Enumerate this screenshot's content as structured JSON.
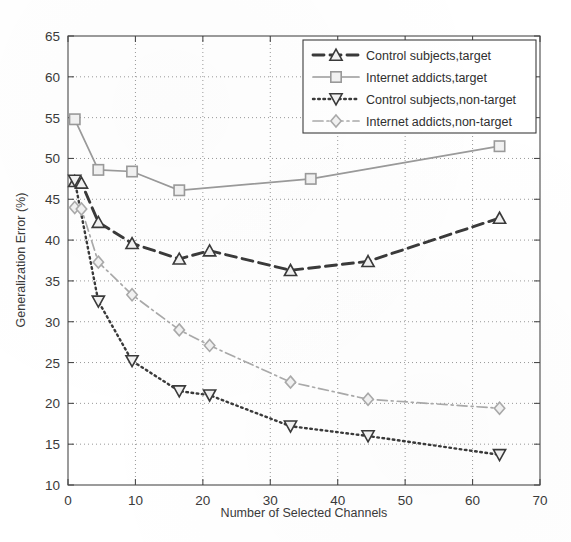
{
  "chart_data": {
    "type": "line",
    "title": "",
    "xlabel": "Number of Selected Channels",
    "ylabel": "Generalization Error (%)",
    "xlim": [
      0,
      70
    ],
    "ylim": [
      10,
      65
    ],
    "xticks": [
      0,
      10,
      20,
      30,
      40,
      50,
      60,
      70
    ],
    "yticks": [
      10,
      15,
      20,
      25,
      30,
      35,
      40,
      45,
      50,
      55,
      60,
      65
    ],
    "grid": true,
    "grid_style": "dotted",
    "legend_position": "top-right",
    "series": [
      {
        "name": "Control subjects,target",
        "marker": "triangle-up",
        "linestyle": "dashed",
        "color": "#3a3a3a",
        "x": [
          1,
          2,
          4.5,
          9.5,
          16.5,
          21,
          33,
          44.5,
          64
        ],
        "y": [
          47.2,
          47.0,
          42.2,
          39.6,
          37.7,
          38.7,
          36.3,
          37.4,
          42.7
        ]
      },
      {
        "name": "Internet addicts,target",
        "marker": "square",
        "linestyle": "solid",
        "color": "#9a9a9a",
        "x": [
          1,
          4.5,
          9.5,
          16.5,
          36,
          64
        ],
        "y": [
          54.8,
          48.6,
          48.4,
          46.1,
          47.5,
          51.5
        ]
      },
      {
        "name": "Control subjects,non-target",
        "marker": "triangle-down",
        "linestyle": "dotted",
        "color": "#3a3a3a",
        "x": [
          1,
          4.5,
          9.5,
          16.5,
          21,
          33,
          44.5,
          64
        ],
        "y": [
          47.3,
          32.5,
          25.2,
          21.5,
          21.0,
          17.2,
          16.0,
          13.7
        ]
      },
      {
        "name": "Internet addicts,non-target",
        "marker": "diamond",
        "linestyle": "dashdot",
        "color": "#aaaaaa",
        "x": [
          1,
          2,
          4.5,
          9.5,
          16.5,
          21,
          33,
          44.5,
          64
        ],
        "y": [
          44.0,
          43.8,
          37.3,
          33.3,
          29.0,
          27.1,
          22.6,
          20.5,
          19.4
        ]
      }
    ]
  },
  "legend": {
    "items": [
      {
        "label": "Control subjects,target"
      },
      {
        "label": "Internet addicts,target"
      },
      {
        "label": "Control subjects,non-target"
      },
      {
        "label": "Internet addicts,non-target"
      }
    ]
  },
  "axes": {
    "x_title": "Number of Selected Channels",
    "y_title": "Generalization Error (%)"
  }
}
